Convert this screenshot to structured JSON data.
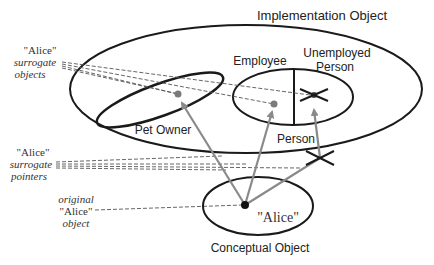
{
  "diagram": {
    "labels": {
      "implementation_object": "Implementation Object",
      "employee": "Employee",
      "unemployed_line1": "Unemployed",
      "unemployed_line2": "Person",
      "person": "Person",
      "pet_owner": "Pet Owner",
      "alice": "\"Alice\"",
      "conceptual_object": "Conceptual Object"
    },
    "annotations": {
      "surrogate_objects": {
        "line1": "\"Alice\"",
        "line2": "surrogate",
        "line3": "objects"
      },
      "surrogate_pointers": {
        "line1": "\"Alice\"",
        "line2": "surrogate",
        "line3": "pointers"
      },
      "original_object": {
        "line1": "original",
        "line2": "\"Alice\"",
        "line3": "object"
      }
    },
    "colors": {
      "outline": "#1a1a1a",
      "pointer": "#8a8a8a",
      "surrogate_dot": "#7a7a7a",
      "dashed": "#555555"
    }
  }
}
